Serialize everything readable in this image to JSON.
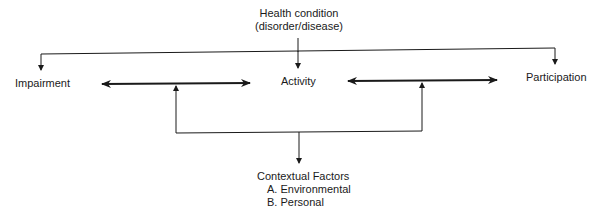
{
  "diagram": {
    "top_node": {
      "line1": "Health condition",
      "line2": "(disorder/disease)"
    },
    "nodes": {
      "impairment": "Impairment",
      "activity": "Activity",
      "participation": "Participation"
    },
    "bottom_node": {
      "title": "Contextual Factors",
      "items": [
        "A. Environmental",
        "B. Personal"
      ]
    },
    "colors": {
      "line": "#1a1a1a",
      "background": "#ffffff"
    }
  }
}
